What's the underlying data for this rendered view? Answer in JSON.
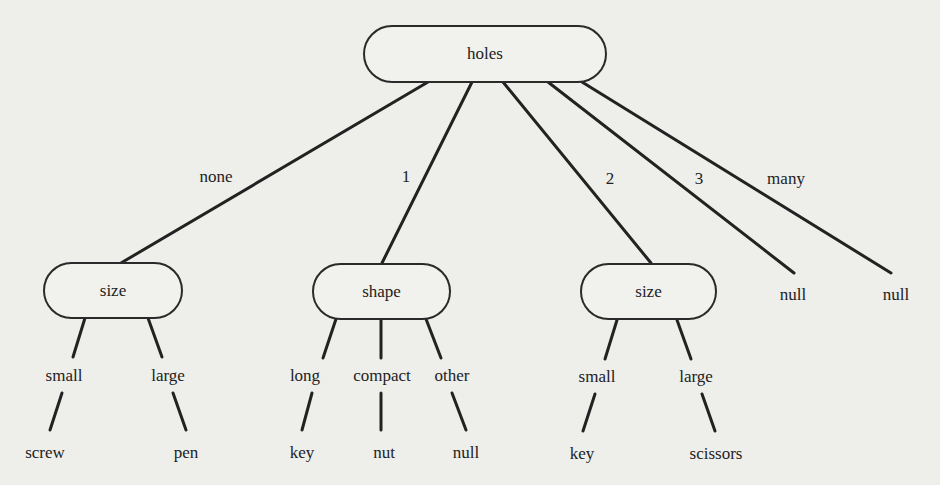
{
  "diagram": {
    "type": "decision-tree",
    "root": {
      "label": "holes",
      "branches": [
        {
          "edge": "none",
          "node": {
            "label": "size",
            "branches": [
              {
                "edge": "small",
                "leaf": "screw"
              },
              {
                "edge": "large",
                "leaf": "pen"
              }
            ]
          }
        },
        {
          "edge": "1",
          "node": {
            "label": "shape",
            "branches": [
              {
                "edge": "long",
                "leaf": "key"
              },
              {
                "edge": "compact",
                "leaf": "nut"
              },
              {
                "edge": "other",
                "leaf": "null"
              }
            ]
          }
        },
        {
          "edge": "2",
          "node": {
            "label": "size",
            "branches": [
              {
                "edge": "small",
                "leaf": "key"
              },
              {
                "edge": "large",
                "leaf": "scissors"
              }
            ]
          }
        },
        {
          "edge": "3",
          "leaf": "null"
        },
        {
          "edge": "many",
          "leaf": "null"
        }
      ]
    }
  },
  "colors": {
    "background": "#eeeeeb",
    "line": "#222222",
    "text": "#222222"
  }
}
